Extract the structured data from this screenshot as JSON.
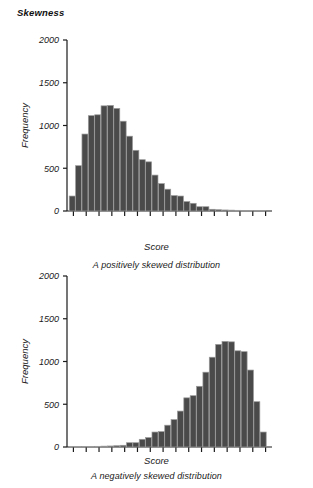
{
  "page": {
    "section_title": "Skewness",
    "background_color": "#ffffff",
    "ink_color": "#1a1a1a"
  },
  "chart_data": [
    {
      "id": "positively-skewed",
      "type": "bar",
      "title": "",
      "caption": "A positively skewed distribution",
      "xlabel": "Score",
      "ylabel": "Frequency",
      "ylim": [
        0,
        2000
      ],
      "yticks": [
        0,
        500,
        1000,
        1500,
        2000
      ],
      "ytick_labels": [
        "0",
        "500",
        "1000",
        "1500",
        "2000"
      ],
      "grid": false,
      "legend": "none",
      "bar_fill": "#4a4a4a",
      "bar_edge": "#9a9a9a",
      "n_xticks": 16,
      "n_bars": 31,
      "categories": [
        1,
        2,
        3,
        4,
        5,
        6,
        7,
        8,
        9,
        10,
        11,
        12,
        13,
        14,
        15,
        16,
        17,
        18,
        19,
        20,
        21,
        22,
        23,
        24,
        25,
        26,
        27,
        28,
        29,
        30,
        31
      ],
      "values": [
        175,
        530,
        900,
        1115,
        1125,
        1230,
        1235,
        1200,
        1050,
        875,
        710,
        600,
        575,
        420,
        320,
        255,
        180,
        175,
        110,
        90,
        50,
        50,
        20,
        15,
        12,
        10,
        8,
        6,
        5,
        4,
        3
      ]
    },
    {
      "id": "negatively-skewed",
      "type": "bar",
      "title": "",
      "caption": "A negatively skewed distribution",
      "xlabel": "Score",
      "ylabel": "Frequency",
      "ylim": [
        0,
        2000
      ],
      "yticks": [
        0,
        500,
        1000,
        1500,
        2000
      ],
      "ytick_labels": [
        "0",
        "500",
        "1000",
        "1500",
        "2000"
      ],
      "grid": false,
      "legend": "none",
      "bar_fill": "#4a4a4a",
      "bar_edge": "#9a9a9a",
      "n_xticks": 16,
      "n_bars": 31,
      "categories": [
        1,
        2,
        3,
        4,
        5,
        6,
        7,
        8,
        9,
        10,
        11,
        12,
        13,
        14,
        15,
        16,
        17,
        18,
        19,
        20,
        21,
        22,
        23,
        24,
        25,
        26,
        27,
        28,
        29,
        30,
        31
      ],
      "values": [
        3,
        4,
        5,
        6,
        8,
        10,
        12,
        15,
        20,
        50,
        50,
        90,
        110,
        175,
        180,
        255,
        320,
        420,
        575,
        600,
        710,
        875,
        1050,
        1200,
        1235,
        1230,
        1125,
        1115,
        900,
        530,
        175
      ]
    }
  ]
}
